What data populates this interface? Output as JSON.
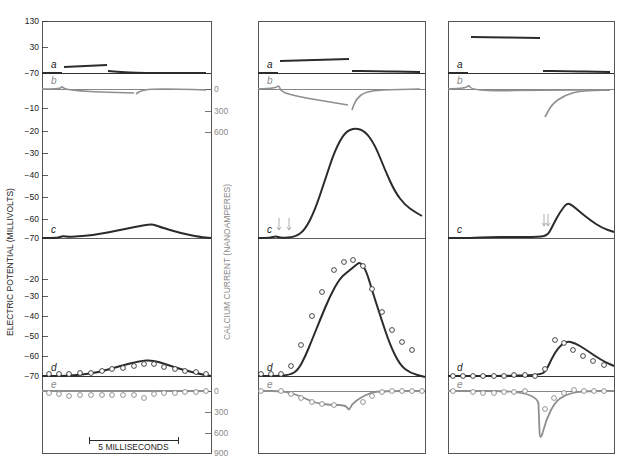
{
  "chart_data": {
    "type": "line",
    "title": "",
    "colors": {
      "dark": "#2b2b2b",
      "gray": "#8f8f8f",
      "frame": "#555555"
    },
    "left_axis": {
      "title": "ELECTRIC POTENTIAL (MILLIVOLTS)",
      "ticks_top": [
        {
          "label": "130",
          "y": 21
        },
        {
          "label": "30",
          "y": 47
        },
        {
          "label": "−70",
          "y": 73
        }
      ],
      "ticks_c": [
        {
          "label": "−10",
          "y": 108
        },
        {
          "label": "−20",
          "y": 131
        },
        {
          "label": "−30",
          "y": 153
        },
        {
          "label": "−40",
          "y": 175
        },
        {
          "label": "−50",
          "y": 197
        },
        {
          "label": "−60",
          "y": 219
        },
        {
          "label": "−70",
          "y": 238
        }
      ],
      "ticks_d": [
        {
          "label": "−20",
          "y": 279
        },
        {
          "label": "−30",
          "y": 296
        },
        {
          "label": "−40",
          "y": 316
        },
        {
          "label": "−50",
          "y": 336
        },
        {
          "label": "−60",
          "y": 356
        },
        {
          "label": "−70",
          "y": 376
        }
      ]
    },
    "right_axis": {
      "title": "CALCIUM CURRENT (NANOAMPERES)",
      "ticks_b": [
        {
          "label": "0",
          "y": 89
        },
        {
          "label": "300",
          "y": 111
        },
        {
          "label": "600",
          "y": 132
        }
      ],
      "ticks_e": [
        {
          "label": "0",
          "y": 391
        },
        {
          "label": "300",
          "y": 412
        },
        {
          "label": "600",
          "y": 433
        },
        {
          "label": "900",
          "y": 453
        }
      ]
    },
    "scale_bar": {
      "label": "5 MILLISECONDS",
      "x1": 89,
      "x2": 178,
      "y": 440
    },
    "row_labels": [
      "a",
      "b",
      "c",
      "d",
      "e"
    ],
    "layout": {
      "top": 21,
      "bottom": 453,
      "row_a_base": 73,
      "row_b_base": 89,
      "row_c_base": 238,
      "row_d_base": 376,
      "row_e_base": 391
    },
    "panels": [
      {
        "name": "panel-1",
        "x0": 42,
        "x1": 211,
        "a_trace": [
          [
            [
              42,
              73
            ],
            [
              62,
              73
            ]
          ],
          [
            [
              64,
              67
            ],
            [
              107,
              65
            ]
          ],
          [
            [
              108,
              71
            ],
            [
              120,
              72
            ],
            [
              140,
              73
            ],
            [
              206,
              73
            ]
          ]
        ],
        "b_trace": [
          [
            [
              42,
              89
            ],
            [
              60,
              89
            ],
            [
              62,
              86
            ],
            [
              64,
              89
            ],
            [
              80,
              91
            ],
            [
              100,
              92
            ],
            [
              134,
              93
            ]
          ],
          [
            [
              136,
              94
            ],
            [
              140,
              91
            ],
            [
              150,
              89
            ],
            [
              180,
              89
            ],
            [
              206,
              90
            ]
          ]
        ],
        "c_trace": [
          [
            42,
            238
          ],
          [
            58,
            238
          ],
          [
            62,
            236
          ],
          [
            70,
            237
          ],
          [
            95,
            235
          ],
          [
            120,
            230
          ],
          [
            140,
            226
          ],
          [
            152,
            224
          ],
          [
            160,
            227
          ],
          [
            180,
            233
          ],
          [
            200,
            237
          ],
          [
            211,
            238
          ]
        ],
        "d_fit": [
          [
            42,
            376
          ],
          [
            60,
            376
          ],
          [
            80,
            375
          ],
          [
            100,
            372
          ],
          [
            120,
            366
          ],
          [
            140,
            361
          ],
          [
            152,
            360
          ],
          [
            165,
            364
          ],
          [
            180,
            369
          ],
          [
            200,
            374
          ],
          [
            211,
            376
          ]
        ],
        "d_points": [
          [
            49,
            374
          ],
          [
            59,
            374
          ],
          [
            69,
            374
          ],
          [
            80,
            373
          ],
          [
            91,
            373
          ],
          [
            102,
            371
          ],
          [
            112,
            369
          ],
          [
            123,
            368
          ],
          [
            134,
            366
          ],
          [
            144,
            364
          ],
          [
            154,
            364
          ],
          [
            164,
            367
          ],
          [
            175,
            369
          ],
          [
            185,
            371
          ],
          [
            196,
            372
          ],
          [
            206,
            374
          ]
        ],
        "e_fit": [
          [
            42,
            391
          ],
          [
            206,
            391
          ]
        ],
        "e_points": [
          [
            49,
            393
          ],
          [
            59,
            394
          ],
          [
            69,
            396
          ],
          [
            80,
            395
          ],
          [
            91,
            395
          ],
          [
            102,
            395
          ],
          [
            112,
            395
          ],
          [
            123,
            395
          ],
          [
            134,
            395
          ],
          [
            144,
            398
          ],
          [
            154,
            394
          ],
          [
            164,
            393
          ],
          [
            175,
            393
          ],
          [
            185,
            392
          ],
          [
            196,
            392
          ],
          [
            206,
            391
          ]
        ],
        "arrows": []
      },
      {
        "name": "panel-2",
        "x0": 258,
        "x1": 425,
        "a_trace": [
          [
            [
              258,
              73
            ],
            [
              278,
              73
            ]
          ],
          [
            [
              280,
              61
            ],
            [
              349,
              59
            ]
          ],
          [
            [
              352,
              71
            ],
            [
              370,
              71
            ],
            [
              420,
              72
            ]
          ]
        ],
        "b_trace": [
          [
            [
              258,
              89
            ],
            [
              276,
              88
            ],
            [
              279,
              85
            ],
            [
              281,
              92
            ],
            [
              300,
              97
            ],
            [
              330,
              102
            ],
            [
              348,
              105
            ]
          ],
          [
            [
              352,
              110
            ],
            [
              356,
              99
            ],
            [
              365,
              92
            ],
            [
              380,
              90
            ],
            [
              420,
              89
            ]
          ]
        ],
        "c_trace": [
          [
            258,
            238
          ],
          [
            270,
            238
          ],
          [
            276,
            236
          ],
          [
            280,
            238
          ],
          [
            295,
            237
          ],
          [
            305,
            230
          ],
          [
            315,
            210
          ],
          [
            325,
            180
          ],
          [
            335,
            150
          ],
          [
            345,
            132
          ],
          [
            355,
            128
          ],
          [
            365,
            131
          ],
          [
            375,
            145
          ],
          [
            385,
            170
          ],
          [
            395,
            192
          ],
          [
            405,
            205
          ],
          [
            415,
            212
          ],
          [
            422,
            216
          ]
        ],
        "d_fit": [
          [
            258,
            376
          ],
          [
            275,
            376
          ],
          [
            290,
            375
          ],
          [
            298,
            370
          ],
          [
            305,
            357
          ],
          [
            312,
            340
          ],
          [
            320,
            320
          ],
          [
            330,
            296
          ],
          [
            340,
            278
          ],
          [
            350,
            270
          ],
          [
            356,
            265
          ],
          [
            360,
            262
          ],
          [
            366,
            270
          ],
          [
            372,
            290
          ],
          [
            380,
            315
          ],
          [
            390,
            345
          ],
          [
            400,
            365
          ],
          [
            410,
            373
          ],
          [
            425,
            377
          ]
        ],
        "d_points": [
          [
            261,
            374
          ],
          [
            271,
            374
          ],
          [
            281,
            374
          ],
          [
            291,
            366
          ],
          [
            301,
            345
          ],
          [
            312,
            316
          ],
          [
            322,
            292
          ],
          [
            334,
            270
          ],
          [
            344,
            262
          ],
          [
            353,
            260
          ],
          [
            363,
            266
          ],
          [
            372,
            289
          ],
          [
            382,
            312
          ],
          [
            392,
            330
          ],
          [
            402,
            342
          ],
          [
            412,
            350
          ]
        ],
        "e_fit": [
          [
            258,
            391
          ],
          [
            285,
            391
          ],
          [
            300,
            396
          ],
          [
            315,
            403
          ],
          [
            330,
            405
          ],
          [
            346,
            405
          ],
          [
            349,
            411
          ],
          [
            352,
            404
          ],
          [
            360,
            398
          ],
          [
            370,
            393
          ],
          [
            380,
            391
          ],
          [
            425,
            391
          ]
        ],
        "e_points": [
          [
            261,
            391
          ],
          [
            281,
            391
          ],
          [
            291,
            394
          ],
          [
            301,
            398
          ],
          [
            312,
            402
          ],
          [
            322,
            404
          ],
          [
            334,
            405
          ],
          [
            363,
            402
          ],
          [
            372,
            396
          ],
          [
            382,
            392
          ],
          [
            392,
            391
          ],
          [
            402,
            391
          ],
          [
            412,
            391
          ],
          [
            422,
            391
          ]
        ],
        "arrows": [
          [
            279,
            230
          ],
          [
            289,
            230
          ]
        ]
      },
      {
        "name": "panel-3",
        "x0": 448,
        "x1": 614,
        "a_trace": [
          [
            [
              448,
              73
            ],
            [
              468,
              73
            ]
          ],
          [
            [
              471,
              37
            ],
            [
              540,
              38
            ]
          ],
          [
            [
              543,
              71
            ],
            [
              560,
              71
            ],
            [
              610,
              72
            ]
          ]
        ],
        "b_trace": [
          [
            [
              448,
              89
            ],
            [
              466,
              88
            ],
            [
              469,
              85
            ],
            [
              471,
              89
            ],
            [
              490,
              91
            ],
            [
              540,
              90
            ],
            [
              610,
              90
            ]
          ],
          [
            [
              545,
              117
            ],
            [
              552,
              104
            ],
            [
              565,
              95
            ],
            [
              580,
              91
            ],
            [
              610,
              90
            ]
          ]
        ],
        "c_trace": [
          [
            448,
            238
          ],
          [
            470,
            238
          ],
          [
            490,
            237
          ],
          [
            510,
            237
          ],
          [
            540,
            237
          ],
          [
            548,
            235
          ],
          [
            553,
            225
          ],
          [
            560,
            212
          ],
          [
            567,
            203
          ],
          [
            572,
            205
          ],
          [
            580,
            212
          ],
          [
            590,
            220
          ],
          [
            602,
            228
          ],
          [
            614,
            232
          ]
        ],
        "d_fit": [
          [
            448,
            376
          ],
          [
            500,
            376
          ],
          [
            540,
            375
          ],
          [
            546,
            371
          ],
          [
            552,
            358
          ],
          [
            558,
            348
          ],
          [
            566,
            341
          ],
          [
            575,
            343
          ],
          [
            585,
            349
          ],
          [
            595,
            356
          ],
          [
            605,
            362
          ],
          [
            614,
            366
          ]
        ],
        "d_points": [
          [
            453,
            376
          ],
          [
            463,
            376
          ],
          [
            473,
            376
          ],
          [
            483,
            376
          ],
          [
            494,
            376
          ],
          [
            504,
            376
          ],
          [
            514,
            375
          ],
          [
            525,
            375
          ],
          [
            535,
            376
          ],
          [
            545,
            369
          ],
          [
            555,
            340
          ],
          [
            564,
            343
          ],
          [
            573,
            350
          ],
          [
            583,
            356
          ],
          [
            593,
            361
          ],
          [
            604,
            365
          ]
        ],
        "e_fit": [
          [
            448,
            391
          ],
          [
            538,
            391
          ],
          [
            539,
            418
          ],
          [
            540,
            443
          ],
          [
            546,
            420
          ],
          [
            555,
            402
          ],
          [
            565,
            395
          ],
          [
            580,
            391
          ],
          [
            614,
            391
          ]
        ],
        "e_points": [
          [
            453,
            391
          ],
          [
            473,
            392
          ],
          [
            483,
            393
          ],
          [
            494,
            393
          ],
          [
            504,
            392
          ],
          [
            514,
            392
          ],
          [
            525,
            391
          ],
          [
            545,
            409
          ],
          [
            554,
            398
          ],
          [
            564,
            393
          ],
          [
            574,
            390
          ],
          [
            584,
            391
          ],
          [
            594,
            391
          ],
          [
            604,
            391
          ]
        ],
        "arrows": [
          [
            544,
            226
          ],
          [
            548,
            226
          ]
        ]
      }
    ]
  }
}
